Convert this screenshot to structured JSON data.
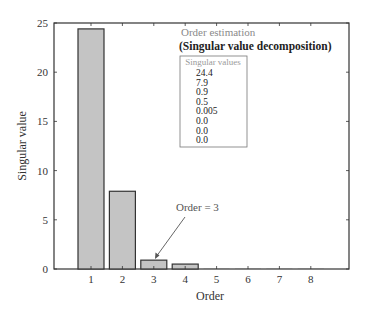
{
  "chart_data": {
    "type": "bar",
    "title": "",
    "xlabel": "Order",
    "ylabel": "Singular value",
    "categories": [
      "1",
      "2",
      "3",
      "4",
      "5",
      "6",
      "7",
      "8"
    ],
    "values": [
      24.4,
      7.9,
      0.9,
      0.5,
      0.005,
      0.0,
      0.0,
      0.0
    ],
    "ylim": [
      0,
      25
    ],
    "xlim": [
      0,
      9
    ],
    "yticks": [
      "0",
      "5",
      "10",
      "15",
      "20",
      "25"
    ],
    "xticks": [
      "1",
      "2",
      "3",
      "4",
      "5",
      "6",
      "7",
      "8"
    ],
    "grid": false,
    "bar_color": "#c4c4c4",
    "bar_edge_color": "#333333",
    "annotations": [
      {
        "text": "Order estimation",
        "kind": "title"
      },
      {
        "text": "(Singular value decomposition)",
        "kind": "subtitle"
      },
      {
        "text": "Order = 3",
        "kind": "arrow",
        "points_to": "3"
      }
    ],
    "table": {
      "title": "Singular values",
      "rows": [
        "24.4",
        "7.9",
        "0.9",
        "0.5",
        "0.005",
        "0.0",
        "0.0",
        "0.0"
      ]
    }
  },
  "labels": {
    "xlabel": "Order",
    "ylabel": "Singular value",
    "annot_title": "Order estimation",
    "annot_subtitle": "(Singular value decomposition)",
    "arrow_text": "Order = 3",
    "box_title": "Singular values"
  }
}
